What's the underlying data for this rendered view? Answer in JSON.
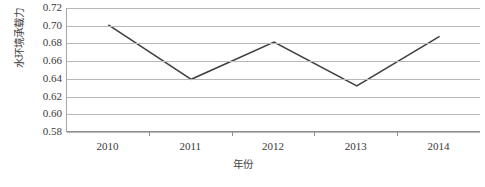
{
  "chart_data": {
    "type": "line",
    "title": "",
    "xlabel": "年份",
    "ylabel": "水环境承载力",
    "categories": [
      "2010",
      "2011",
      "2012",
      "2013",
      "2014"
    ],
    "values": [
      0.701,
      0.6395,
      0.6815,
      0.632,
      0.688
    ],
    "series": [
      {
        "name": "水环境承载力",
        "values": [
          0.701,
          0.6395,
          0.6815,
          0.632,
          0.688
        ]
      }
    ],
    "ylim": [
      0.58,
      0.72
    ],
    "ytick_step": 0.02,
    "yticks": [
      "0.72",
      "0.70",
      "0.68",
      "0.66",
      "0.64",
      "0.62",
      "0.60",
      "0.58"
    ],
    "ytick_values": [
      0.72,
      0.7,
      0.68,
      0.66,
      0.64,
      0.62,
      0.6,
      0.58
    ],
    "grid": true,
    "grid_axis": "y",
    "legend": false,
    "legend_position": "none",
    "markers": false,
    "line_color": "#404040",
    "gridline_color": "#b7b7b7",
    "axis_color": "#8f8f8f",
    "background_color": "#ffffff"
  }
}
